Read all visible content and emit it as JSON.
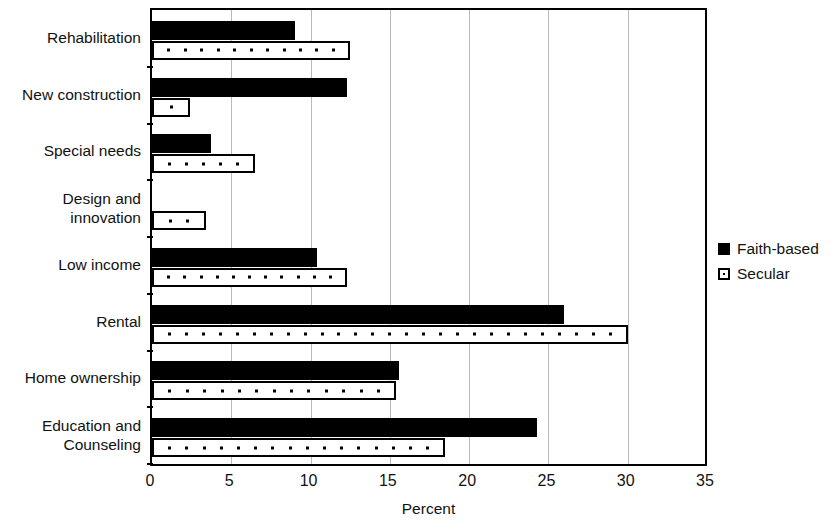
{
  "chart_data": {
    "type": "bar",
    "orientation": "horizontal",
    "title": "",
    "xlabel": "Percent",
    "ylabel": "",
    "xlim": [
      0,
      35
    ],
    "xticks": [
      0,
      5,
      10,
      15,
      20,
      25,
      30,
      35
    ],
    "xtick_labels": [
      "0",
      "5",
      "10",
      "15",
      "20",
      "25",
      "30",
      "35"
    ],
    "grid": true,
    "grid_axis": "x",
    "legend_position": "right",
    "categories": [
      "Rehabilitation",
      "New construction",
      "Special needs",
      "Design and\ninnovation",
      "Low income",
      "Rental",
      "Home ownership",
      "Education and\nCounseling"
    ],
    "series": [
      {
        "name": "Faith-based",
        "color": "#000000",
        "fill": "solid",
        "values": [
          9.0,
          12.3,
          3.7,
          0,
          10.4,
          26.0,
          15.6,
          24.3
        ]
      },
      {
        "name": "Secular",
        "color": "#ffffff",
        "fill": "dotted",
        "values": [
          12.5,
          2.4,
          6.5,
          3.4,
          12.3,
          30.0,
          15.4,
          18.5
        ]
      }
    ]
  },
  "legend": {
    "items": [
      {
        "label": "Faith-based",
        "swatch": "filled-square-icon"
      },
      {
        "label": "Secular",
        "swatch": "dotted-square-icon"
      }
    ]
  },
  "axis": {
    "x_title": "Percent"
  }
}
